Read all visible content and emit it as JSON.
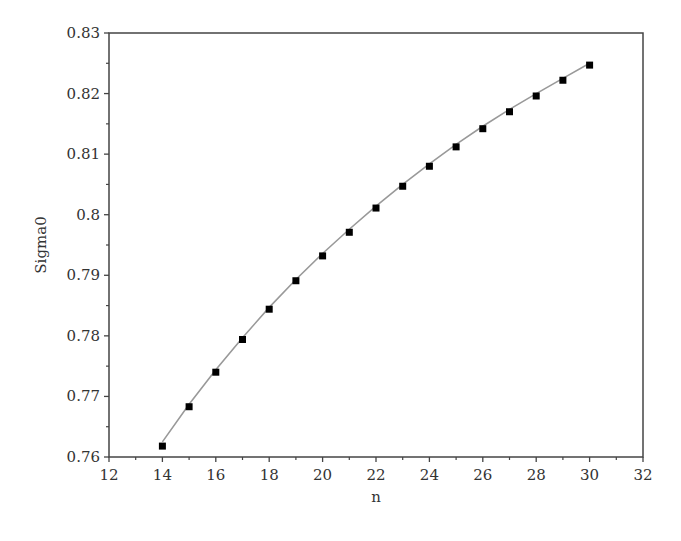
{
  "chart_data": {
    "type": "scatter",
    "title": "",
    "xlabel": "n",
    "ylabel": "Sigma0",
    "xlim": [
      12,
      32
    ],
    "ylim": [
      0.76,
      0.83
    ],
    "x_ticks": [
      12,
      14,
      16,
      18,
      20,
      22,
      24,
      26,
      28,
      30,
      32
    ],
    "x_tick_labels": [
      "12",
      "14",
      "16",
      "18",
      "20",
      "22",
      "24",
      "26",
      "28",
      "30",
      "32"
    ],
    "y_ticks": [
      0.76,
      0.77,
      0.78,
      0.79,
      0.8,
      0.81,
      0.82,
      0.83
    ],
    "y_tick_labels": [
      "0.76",
      "0.77",
      "0.78",
      "0.79",
      "0.8",
      "0.81",
      "0.82",
      "0.83"
    ],
    "grid": false,
    "legend": null,
    "series": [
      {
        "name": "data",
        "style": "markers",
        "marker": "square",
        "color": "#000000",
        "x": [
          14,
          15,
          16,
          17,
          18,
          19,
          20,
          21,
          22,
          23,
          24,
          25,
          26,
          27,
          28,
          29,
          30
        ],
        "y": [
          0.7618,
          0.7683,
          0.774,
          0.7794,
          0.7844,
          0.7891,
          0.7932,
          0.7971,
          0.8011,
          0.8047,
          0.808,
          0.8112,
          0.8142,
          0.817,
          0.8196,
          0.8222,
          0.8247
        ]
      },
      {
        "name": "fit",
        "style": "line",
        "color": "#999999",
        "x": [
          14,
          15,
          16,
          17,
          18,
          19,
          20,
          21,
          22,
          23,
          24,
          25,
          26,
          27,
          28,
          29,
          30
        ],
        "y": [
          0.7625,
          0.7687,
          0.7744,
          0.7797,
          0.7847,
          0.7893,
          0.7936,
          0.7976,
          0.8014,
          0.805,
          0.8084,
          0.8116,
          0.8146,
          0.8174,
          0.82,
          0.8225,
          0.825
        ]
      }
    ]
  }
}
